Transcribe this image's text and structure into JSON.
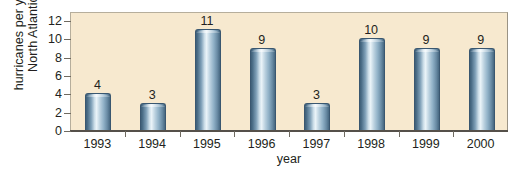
{
  "chart_data": {
    "type": "bar",
    "title": "",
    "xlabel": "year",
    "ylabel": "hurricanes per year, North Atlantic",
    "ylabel_lines": [
      "hurricanes per year,",
      "North Atlantic"
    ],
    "categories": [
      "1993",
      "1994",
      "1995",
      "1996",
      "1997",
      "1998",
      "1999",
      "2000"
    ],
    "values": [
      4,
      3,
      11,
      9,
      3,
      10,
      9,
      9
    ],
    "value_labels": [
      "4",
      "3",
      "11",
      "9",
      "3",
      "10",
      "9",
      "9"
    ],
    "ylim": [
      0,
      13
    ],
    "yticks": [
      0,
      2,
      4,
      6,
      8,
      10,
      12
    ],
    "ytick_labels": [
      "0",
      "2",
      "4",
      "6",
      "8",
      "10",
      "12"
    ],
    "grid": false,
    "legend": false,
    "colors": {
      "plot_background": "#f7e9cf",
      "page_background": "#ffffff",
      "bar_edge": "#3a5770",
      "bar_light": "#eaf3f8",
      "bar_dark": "#3f5f78",
      "axis": "#55504a",
      "text": "#231f20"
    }
  }
}
